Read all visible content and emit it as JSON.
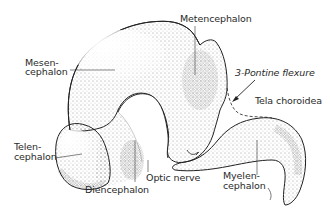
{
  "diagram": {
    "colors": {
      "outline": "#222222",
      "stipple": "#333333",
      "background": "#ffffff",
      "text": "#2a2a2a"
    },
    "labels": {
      "metencephalon": "Metencephalon",
      "mesencephalon_1": "Mesen-",
      "mesencephalon_2": "cephalon",
      "pontine_flexure": "3-Pontine flexure",
      "tela_choroidea": "Tela choroidea",
      "telencephalon_1": "Telen-",
      "telencephalon_2": "cephalon",
      "optic_nerve": "Optic nerve",
      "diencephalon": "Diencephalon",
      "myelencephalon_1": "Myelen-",
      "myelencephalon_2": "cephalon"
    }
  }
}
